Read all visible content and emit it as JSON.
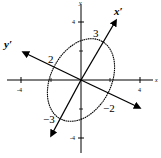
{
  "diagram": {
    "type": "rotated-ellipse-on-coordinate-axes",
    "axes": {
      "x_label": "x",
      "y_label": "y",
      "x_ticks": [
        "-4",
        "4"
      ],
      "y_ticks": [
        "4",
        "-4"
      ]
    },
    "rotated_axes": {
      "x_prime_label": "x′",
      "y_prime_label": "y′"
    },
    "ellipse_labels": {
      "x_prime_positive": "3",
      "x_prime_negative": "−3",
      "y_prime_positive": "2",
      "y_prime_negative": "−2"
    },
    "colors": {
      "stroke": "#000000",
      "background": "#ffffff"
    }
  }
}
